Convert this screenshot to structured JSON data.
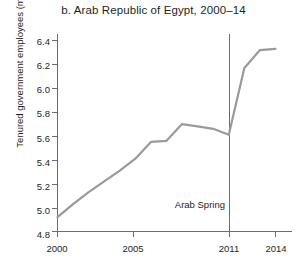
{
  "chart_data": {
    "type": "line",
    "title": "b. Arab Republic of Egypt, 2000–14",
    "xlabel": "",
    "ylabel": "Tenured government employees (millions)",
    "x": [
      2000,
      2001,
      2002,
      2003,
      2004,
      2005,
      2006,
      2007,
      2008,
      2009,
      2010,
      2011,
      2012,
      2013,
      2014
    ],
    "values": [
      4.92,
      5.03,
      5.13,
      5.22,
      5.31,
      5.41,
      5.55,
      5.56,
      5.7,
      5.68,
      5.66,
      5.61,
      6.17,
      6.32,
      6.33
    ],
    "series": [
      {
        "name": "Tenured government employees",
        "values": [
          4.92,
          5.03,
          5.13,
          5.22,
          5.31,
          5.41,
          5.55,
          5.56,
          5.7,
          5.68,
          5.66,
          5.61,
          6.17,
          6.32,
          6.33
        ]
      }
    ],
    "xlim": [
      2000,
      2014
    ],
    "ylim": [
      4.8,
      6.4
    ],
    "xticks": [
      "2000",
      "2005",
      "2011",
      "2014"
    ],
    "xtick_values": [
      2000,
      2005,
      2011,
      2014
    ],
    "yticks": [
      "6.4",
      "6.2",
      "6.0",
      "5.8",
      "5.6",
      "5.4",
      "5.2",
      "5.0",
      "4.8"
    ],
    "ytick_values": [
      6.4,
      6.2,
      6.0,
      5.8,
      5.6,
      5.4,
      5.2,
      5.0,
      4.8
    ],
    "grid": false,
    "legend": false,
    "annotations": [
      {
        "label": "Arab Spring",
        "x": 2011,
        "type": "vertical-line-with-label"
      }
    ],
    "colors": {
      "line": "#9a9a9a",
      "axis": "#6d6d6d",
      "text": "#231f20",
      "background": "#ffffff"
    }
  }
}
